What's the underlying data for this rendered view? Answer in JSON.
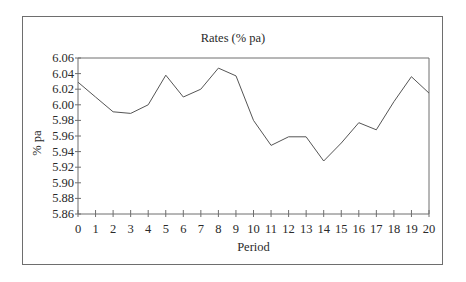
{
  "chart_data": {
    "type": "line",
    "title": "Rates (% pa)",
    "xlabel": "Period",
    "ylabel": "% pa",
    "x": [
      0,
      1,
      2,
      3,
      4,
      5,
      6,
      7,
      8,
      9,
      10,
      11,
      12,
      13,
      14,
      15,
      16,
      17,
      18,
      19,
      20
    ],
    "series": [
      {
        "name": "Rates (% pa)",
        "values": [
          6.029,
          6.01,
          5.991,
          5.989,
          6.0,
          6.038,
          6.01,
          6.02,
          6.047,
          6.037,
          5.98,
          5.948,
          5.959,
          5.959,
          5.928,
          5.951,
          5.977,
          5.968,
          6.004,
          6.036,
          6.015
        ]
      }
    ],
    "xlim": [
      0,
      20
    ],
    "ylim": [
      5.86,
      6.06
    ],
    "x_ticks": [
      "0",
      "1",
      "2",
      "3",
      "4",
      "5",
      "6",
      "7",
      "8",
      "9",
      "10",
      "11",
      "12",
      "13",
      "14",
      "15",
      "16",
      "17",
      "18",
      "19",
      "20"
    ],
    "y_ticks": [
      "5.86",
      "5.88",
      "5.90",
      "5.92",
      "5.94",
      "5.96",
      "5.98",
      "6.00",
      "6.02",
      "6.04",
      "6.06"
    ],
    "grid": false,
    "legend": "none",
    "line_color": "#555555"
  }
}
